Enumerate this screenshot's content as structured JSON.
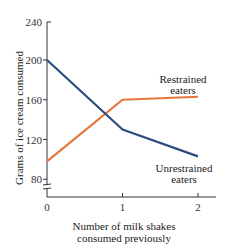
{
  "chart_data": {
    "type": "line",
    "title": "",
    "xlabel": "Number of milk shakes consumed previously",
    "xlabel_lines": [
      "Number of milk shakes",
      "consumed previously"
    ],
    "ylabel": "Grams of ice cream consumed",
    "x": [
      0,
      1,
      2
    ],
    "x_tick_labels": [
      "0",
      "1",
      "2"
    ],
    "y_ticks": [
      80,
      120,
      160,
      200,
      240
    ],
    "y_tick_labels": [
      "80",
      "120",
      "160",
      "200",
      "240"
    ],
    "ylim": [
      70,
      240
    ],
    "y_axis_break": true,
    "grid": false,
    "legend_position": "inline labels at right end of lines",
    "series": [
      {
        "name": "Restrained eaters",
        "label_lines": [
          "Restrained",
          "eaters"
        ],
        "values": [
          98,
          160,
          163
        ],
        "color": "#e8743b"
      },
      {
        "name": "Unrestrained eaters",
        "label_lines": [
          "Unrestrained",
          "eaters"
        ],
        "values": [
          200,
          130,
          103
        ],
        "color": "#2b4a7e"
      }
    ]
  }
}
